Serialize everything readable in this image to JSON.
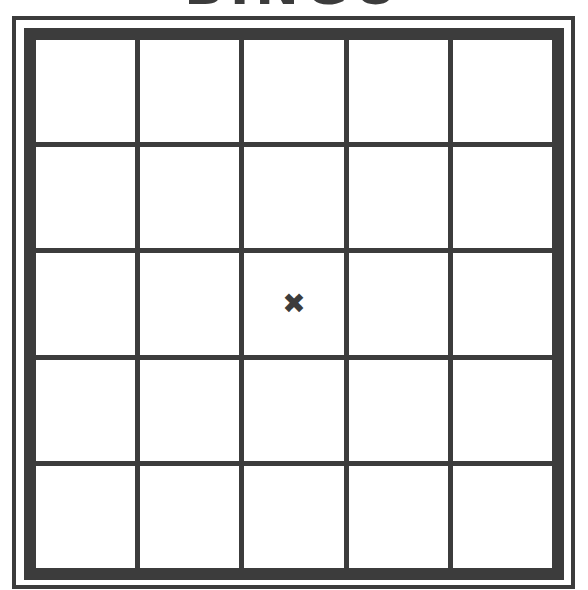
{
  "title": "BINGO",
  "colors": {
    "line": "#3c3c3c",
    "background": "#ffffff"
  },
  "board": {
    "rows": 5,
    "columns": 5,
    "cells": [
      [
        "",
        "",
        "",
        "",
        ""
      ],
      [
        "",
        "",
        "",
        "",
        ""
      ],
      [
        "",
        "",
        "✖",
        "",
        ""
      ],
      [
        "",
        "",
        "",
        "",
        ""
      ],
      [
        "",
        "",
        "",
        "",
        ""
      ]
    ],
    "free_space": {
      "row": 2,
      "column": 2,
      "icon": "x-mark-icon",
      "glyph": "✖"
    }
  }
}
